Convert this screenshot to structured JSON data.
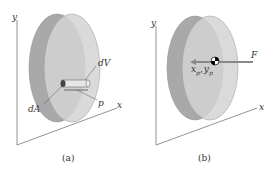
{
  "panels": [
    {
      "caption": "(a)",
      "axes": {
        "y": "y",
        "x": "x"
      },
      "labels": {
        "volume_element": "dV",
        "area_element": "dA",
        "pressure": "p"
      }
    },
    {
      "caption": "(b)",
      "axes": {
        "y": "y",
        "x": "x"
      },
      "labels": {
        "force": "F",
        "center_x": "x",
        "center_x_sub": "p",
        "comma": ",",
        "center_y": "y",
        "center_y_sub": "p"
      }
    }
  ],
  "colors": {
    "back_disk": "#a8a8a8",
    "front_disk": "#cfcfcf",
    "overlap": "#bdbdbd",
    "axis": "#666666",
    "arrow": "#8a8a8a"
  }
}
